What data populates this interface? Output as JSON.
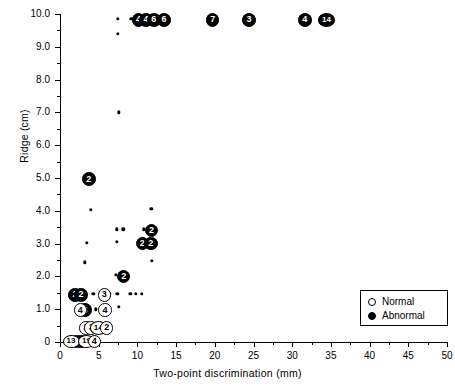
{
  "chart_data": {
    "type": "scatter",
    "title": "",
    "xlabel": "Two-point discrimination (mm)",
    "ylabel": "Ridge (cm)",
    "xlim": [
      0,
      50
    ],
    "ylim": [
      0,
      10
    ],
    "xticks": [
      0,
      5,
      10,
      15,
      20,
      25,
      30,
      35,
      40,
      45,
      50
    ],
    "xticklabels": [
      "0",
      "5",
      "10",
      "15",
      "20",
      "25",
      "30",
      "35",
      "40",
      "45",
      "50"
    ],
    "xminorticks": [
      2.5,
      7.5,
      12.5,
      17.5,
      22.5,
      27.5,
      32.5,
      37.5,
      42.5,
      47.5
    ],
    "yticks": [
      0,
      1,
      2,
      3,
      4,
      5,
      6,
      7,
      8,
      9,
      10
    ],
    "yticklabels": [
      "0",
      "1.0",
      "2.0",
      "3.0",
      "4.0",
      "5.0",
      "6.0",
      "7.0",
      "8.0",
      "9.0",
      "10.0"
    ],
    "yminorticks": [
      0.5,
      1.5,
      2.5,
      3.5,
      4.5,
      5.5,
      6.5,
      7.5,
      8.5,
      9.5
    ],
    "grid": false,
    "legend_position": "right-lower",
    "legend": [
      {
        "label": "Normal",
        "marker": "open-circle"
      },
      {
        "label": "Abnormal",
        "marker": "filled-circle"
      }
    ],
    "series": [
      {
        "name": "Abnormal",
        "marker": "filled-circle",
        "note": "Numbers inside markers denote count of coincident observations; unlabeled small dots are single observations.",
        "points": [
          {
            "x": 7.5,
            "y": 9.85,
            "count": 1,
            "label": ""
          },
          {
            "x": 7.5,
            "y": 9.4,
            "count": 1,
            "label": ""
          },
          {
            "x": 9.2,
            "y": 9.85,
            "count": 1,
            "label": ""
          },
          {
            "x": 10.0,
            "y": 9.85,
            "count": 4,
            "label": "4"
          },
          {
            "x": 11.0,
            "y": 9.85,
            "count": 4,
            "label": "4"
          },
          {
            "x": 12.0,
            "y": 9.85,
            "count": 6,
            "label": "6"
          },
          {
            "x": 13.3,
            "y": 9.85,
            "count": 6,
            "label": "6"
          },
          {
            "x": 19.6,
            "y": 9.85,
            "count": 7,
            "label": "7"
          },
          {
            "x": 24.3,
            "y": 9.85,
            "count": 3,
            "label": "3"
          },
          {
            "x": 31.5,
            "y": 9.85,
            "count": 4,
            "label": "4"
          },
          {
            "x": 34.3,
            "y": 9.85,
            "count": 14,
            "label": "14"
          },
          {
            "x": 7.6,
            "y": 7.0,
            "count": 1,
            "label": ""
          },
          {
            "x": 3.6,
            "y": 5.0,
            "count": 2,
            "label": "2"
          },
          {
            "x": 4.0,
            "y": 4.03,
            "count": 1,
            "label": ""
          },
          {
            "x": 11.8,
            "y": 4.06,
            "count": 1,
            "label": ""
          },
          {
            "x": 7.3,
            "y": 3.43,
            "count": 1,
            "label": ""
          },
          {
            "x": 8.2,
            "y": 3.43,
            "count": 1,
            "label": ""
          },
          {
            "x": 10.8,
            "y": 3.43,
            "count": 1,
            "label": ""
          },
          {
            "x": 11.7,
            "y": 3.43,
            "count": 2,
            "label": "2"
          },
          {
            "x": 3.5,
            "y": 3.03,
            "count": 1,
            "label": ""
          },
          {
            "x": 7.3,
            "y": 3.05,
            "count": 1,
            "label": ""
          },
          {
            "x": 10.5,
            "y": 3.03,
            "count": 2,
            "label": "2"
          },
          {
            "x": 11.6,
            "y": 3.03,
            "count": 2,
            "label": "2"
          },
          {
            "x": 3.2,
            "y": 2.43,
            "count": 1,
            "label": ""
          },
          {
            "x": 11.9,
            "y": 2.47,
            "count": 1,
            "label": ""
          },
          {
            "x": 7.2,
            "y": 2.05,
            "count": 1,
            "label": ""
          },
          {
            "x": 8.1,
            "y": 2.02,
            "count": 2,
            "label": "2"
          },
          {
            "x": 1.8,
            "y": 1.47,
            "count": 2,
            "label": "2"
          },
          {
            "x": 2.6,
            "y": 1.47,
            "count": 2,
            "label": "2"
          },
          {
            "x": 4.3,
            "y": 1.47,
            "count": 1,
            "label": ""
          },
          {
            "x": 6.4,
            "y": 1.47,
            "count": 1,
            "label": ""
          },
          {
            "x": 7.4,
            "y": 1.47,
            "count": 1,
            "label": ""
          },
          {
            "x": 9.1,
            "y": 1.47,
            "count": 1,
            "label": ""
          },
          {
            "x": 9.8,
            "y": 1.47,
            "count": 1,
            "label": ""
          },
          {
            "x": 10.6,
            "y": 1.47,
            "count": 1,
            "label": ""
          },
          {
            "x": 3.1,
            "y": 1.0,
            "count": 3,
            "label": "3"
          },
          {
            "x": 4.6,
            "y": 1.0,
            "count": 1,
            "label": ""
          },
          {
            "x": 7.6,
            "y": 1.07,
            "count": 1,
            "label": ""
          },
          {
            "x": 2.0,
            "y": 0.05,
            "count": 2,
            "label": "2"
          },
          {
            "x": 2.6,
            "y": 0.05,
            "count": 3,
            "label": "3"
          }
        ]
      },
      {
        "name": "Normal",
        "marker": "open-circle",
        "points": [
          {
            "x": 5.6,
            "y": 1.47,
            "count": 3,
            "label": "3"
          },
          {
            "x": 2.5,
            "y": 1.0,
            "count": 4,
            "label": "4"
          },
          {
            "x": 5.7,
            "y": 1.0,
            "count": 4,
            "label": "4"
          },
          {
            "x": 3.2,
            "y": 0.46,
            "count": 3,
            "label": "3"
          },
          {
            "x": 3.9,
            "y": 0.46,
            "count": 3,
            "label": "3"
          },
          {
            "x": 4.8,
            "y": 0.46,
            "count": 14,
            "label": "14"
          },
          {
            "x": 5.9,
            "y": 0.46,
            "count": 2,
            "label": "2"
          },
          {
            "x": 1.3,
            "y": 0.05,
            "count": 13,
            "label": "13"
          },
          {
            "x": 3.3,
            "y": 0.05,
            "count": 19,
            "label": "19"
          },
          {
            "x": 4.3,
            "y": 0.05,
            "count": 4,
            "label": "4"
          }
        ]
      }
    ]
  }
}
